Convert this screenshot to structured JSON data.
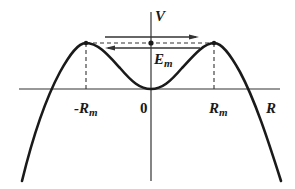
{
  "diagram": {
    "type": "potential-energy-curve",
    "axes": {
      "vertical_label": "V",
      "horizontal_label": "R",
      "origin_label": "0"
    },
    "ticks": {
      "neg_rm": {
        "main": "-R",
        "sub": "m"
      },
      "pos_rm": {
        "main": "R",
        "sub": "m"
      }
    },
    "energy_level": {
      "main": "E",
      "sub": "m"
    },
    "arrows": [
      {
        "direction": "right",
        "description": "top arrow toward +R"
      },
      {
        "direction": "left",
        "description": "bottom arrow toward -R"
      }
    ],
    "colors": {
      "curve": "#1a1a1a",
      "axes": "#333333",
      "dashed": "#333333",
      "background": "#ffffff"
    }
  }
}
